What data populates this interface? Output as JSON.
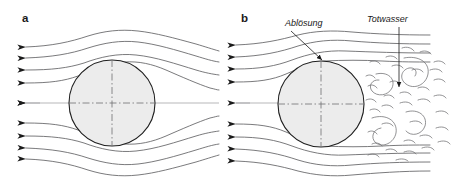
{
  "figure": {
    "width": 451,
    "height": 183,
    "background_color": "#ffffff",
    "panels": [
      {
        "id": "a",
        "label": "a",
        "label_x": 22,
        "label_y": 22,
        "description": "ideal frictionless flow, streamlines close symmetrically behind the sphere",
        "sphere": {
          "cx": 112,
          "cy": 103,
          "r": 43
        },
        "inlet_arrow_count": 9,
        "callouts": []
      },
      {
        "id": "b",
        "label": "b",
        "label_x": 241,
        "label_y": 22,
        "description": "real viscous flow, boundary layer separates and a turbulent dead-water wake forms",
        "sphere": {
          "cx": 321,
          "cy": 104,
          "r": 43
        },
        "inlet_arrow_count": 9,
        "callouts": [
          {
            "id": "abloesung",
            "label": "Ablösung",
            "label_x": 285,
            "label_y": 26,
            "leader_from_x": 291,
            "leader_from_y": 31,
            "leader_to_x": 323,
            "leader_to_y": 61
          },
          {
            "id": "totwasser",
            "label": "Totwasser",
            "label_x": 367,
            "label_y": 22,
            "leader_from_x": 399,
            "leader_from_y": 27,
            "leader_to_x": 399,
            "leader_to_y": 88
          }
        ]
      }
    ],
    "colors": {
      "streamline": "#58585a",
      "sphere_fill": "#ececec",
      "sphere_outline": "#1f1f1f",
      "centerline": "#707072",
      "axis": "#9a9a9c",
      "wake": "#6d6d70",
      "text": "#1a1a1a"
    }
  }
}
